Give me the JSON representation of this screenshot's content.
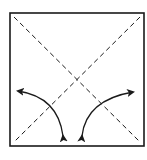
{
  "diagram": {
    "type": "origami-fold-instruction",
    "square": {
      "x": 10,
      "y": 13,
      "width": 134,
      "height": 133
    },
    "creases": [
      {
        "name": "diagonal-tl-br",
        "style": "dashed"
      },
      {
        "name": "diagonal-tr-bl",
        "style": "dashed"
      }
    ],
    "arrows": [
      {
        "name": "left-fold-arrow",
        "direction": "bidirectional",
        "from": "left",
        "to": "bottom"
      },
      {
        "name": "right-fold-arrow",
        "direction": "bidirectional",
        "from": "right",
        "to": "bottom"
      }
    ],
    "colors": {
      "line": "#1a1a1a",
      "background": "#ffffff"
    }
  }
}
